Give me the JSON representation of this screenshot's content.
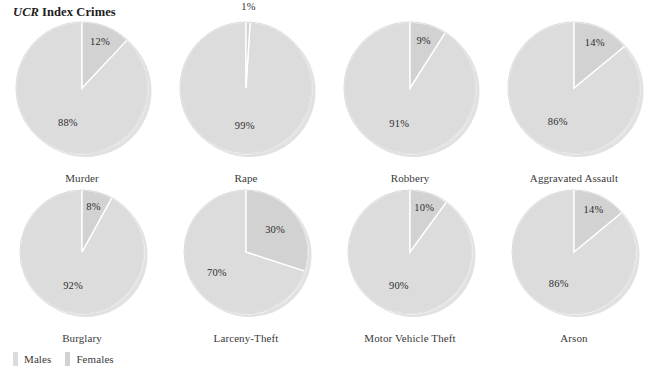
{
  "title": {
    "abbr": "UCR",
    "rest": "Index Crimes"
  },
  "legend": {
    "items": [
      {
        "label": "Males",
        "color": "#dcdcdc",
        "swatch_name": "legend-swatch-males"
      },
      {
        "label": "Females",
        "color": "#d2d2d2",
        "swatch_name": "legend-swatch-females"
      }
    ]
  },
  "chart_data": {
    "type": "pie",
    "legend_position": "bottom-left",
    "series": [
      {
        "name": "Males",
        "color": "#dcdcdc"
      },
      {
        "name": "Females",
        "color": "#d2d2d2"
      }
    ],
    "units": "percent",
    "charts": [
      {
        "label": "Murder",
        "values": [
          88,
          12
        ],
        "labels": [
          "88%",
          "12%"
        ],
        "label_outside": [
          false,
          false
        ]
      },
      {
        "label": "Rape",
        "values": [
          99,
          1
        ],
        "labels": [
          "99%",
          "1%"
        ],
        "label_outside": [
          false,
          true
        ]
      },
      {
        "label": "Robbery",
        "values": [
          91,
          9
        ],
        "labels": [
          "91%",
          "9%"
        ],
        "label_outside": [
          false,
          false
        ]
      },
      {
        "label": "Aggravated Assault",
        "values": [
          86,
          14
        ],
        "labels": [
          "86%",
          "14%"
        ],
        "label_outside": [
          false,
          false
        ]
      },
      {
        "label": "Burglary",
        "values": [
          92,
          8
        ],
        "labels": [
          "92%",
          "8%"
        ],
        "label_outside": [
          false,
          false
        ]
      },
      {
        "label": "Larceny-Theft",
        "values": [
          70,
          30
        ],
        "labels": [
          "70%",
          "30%"
        ],
        "label_outside": [
          false,
          false
        ]
      },
      {
        "label": "Motor Vehicle Theft",
        "values": [
          90,
          10
        ],
        "labels": [
          "90%",
          "10%"
        ],
        "label_outside": [
          false,
          false
        ]
      },
      {
        "label": "Arson",
        "values": [
          86,
          14
        ],
        "labels": [
          "86%",
          "14%"
        ],
        "label_outside": [
          false,
          false
        ]
      }
    ]
  },
  "layout": {
    "columns": 4,
    "rows": 2,
    "cell_width": 164,
    "row_tops": [
      22,
      190
    ],
    "radius": [
      66,
      62
    ],
    "caption_tops": [
      162,
      330
    ]
  }
}
